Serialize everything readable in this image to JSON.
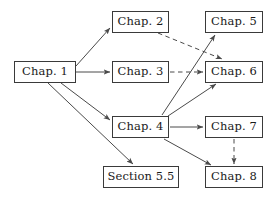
{
  "diagram": {
    "background_color": "#ffffff",
    "line_color": "#4a4a4a",
    "border_color": "#3a3a3a",
    "text_color": "#1a1a1a",
    "nodes": [
      {
        "id": "chap1",
        "label": "Chap. 1",
        "x": 14,
        "y": 61,
        "w": 62,
        "h": 22
      },
      {
        "id": "chap2",
        "label": "Chap. 2",
        "x": 112,
        "y": 11,
        "w": 57,
        "h": 22
      },
      {
        "id": "chap3",
        "label": "Chap. 3",
        "x": 112,
        "y": 61,
        "w": 57,
        "h": 22
      },
      {
        "id": "chap4",
        "label": "Chap. 4",
        "x": 112,
        "y": 116,
        "w": 57,
        "h": 22
      },
      {
        "id": "chap5",
        "label": "Chap. 5",
        "x": 205,
        "y": 11,
        "w": 58,
        "h": 22
      },
      {
        "id": "chap6",
        "label": "Chap. 6",
        "x": 205,
        "y": 61,
        "w": 58,
        "h": 22
      },
      {
        "id": "chap7",
        "label": "Chap. 7",
        "x": 205,
        "y": 116,
        "w": 58,
        "h": 22
      },
      {
        "id": "chap8",
        "label": "Chap. 8",
        "x": 205,
        "y": 166,
        "w": 58,
        "h": 22
      },
      {
        "id": "sec55",
        "label": "Section 5.5",
        "x": 103,
        "y": 166,
        "w": 76,
        "h": 22
      }
    ],
    "edges": [
      {
        "from": "chap1",
        "to": "chap2",
        "style": "solid",
        "x1": 76,
        "y1": 66,
        "x2": 110,
        "y2": 28
      },
      {
        "from": "chap1",
        "to": "chap3",
        "style": "solid",
        "x1": 76,
        "y1": 72,
        "x2": 110,
        "y2": 72
      },
      {
        "from": "chap1",
        "to": "chap4",
        "style": "solid",
        "x1": 61,
        "y1": 83,
        "x2": 110,
        "y2": 120
      },
      {
        "from": "chap1",
        "to": "sec55",
        "style": "solid",
        "x1": 48,
        "y1": 83,
        "x2": 133,
        "y2": 164
      },
      {
        "from": "chap2",
        "to": "chap6",
        "style": "dashed",
        "x1": 158,
        "y1": 33,
        "x2": 222,
        "y2": 59
      },
      {
        "from": "chap3",
        "to": "chap6",
        "style": "dashed",
        "x1": 170,
        "y1": 72,
        "x2": 203,
        "y2": 72
      },
      {
        "from": "chap4",
        "to": "chap5",
        "style": "solid",
        "x1": 162,
        "y1": 115,
        "x2": 215,
        "y2": 35
      },
      {
        "from": "chap4",
        "to": "chap6",
        "style": "solid",
        "x1": 168,
        "y1": 116,
        "x2": 216,
        "y2": 84
      },
      {
        "from": "chap4",
        "to": "chap7",
        "style": "solid",
        "x1": 170,
        "y1": 127,
        "x2": 203,
        "y2": 127
      },
      {
        "from": "chap4",
        "to": "chap8",
        "style": "solid",
        "x1": 164,
        "y1": 139,
        "x2": 211,
        "y2": 165
      },
      {
        "from": "chap7",
        "to": "chap8",
        "style": "dashed",
        "x1": 234,
        "y1": 139,
        "x2": 234,
        "y2": 164
      }
    ]
  }
}
